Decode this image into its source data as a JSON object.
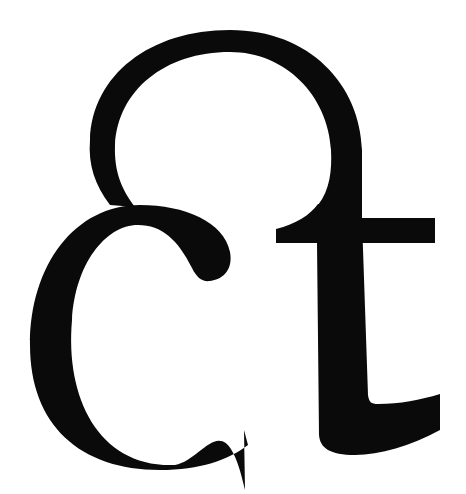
{
  "image": {
    "subject": "ct ligature glyph",
    "text": "ct",
    "background_color": "#ffffff",
    "glyph_color": "#0a0a0a"
  }
}
